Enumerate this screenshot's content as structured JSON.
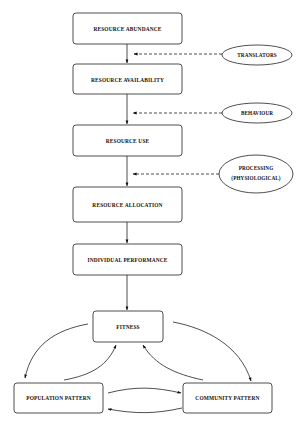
{
  "diagram": {
    "main_chain": [
      {
        "id": "abundance",
        "label": "RESOURCE ABUNDANCE"
      },
      {
        "id": "availability",
        "label": "RESOURCE AVAILABILITY"
      },
      {
        "id": "use",
        "label": "RESOURCE USE"
      },
      {
        "id": "allocation",
        "label": "RESOURCE ALLOCATION"
      },
      {
        "id": "performance",
        "label": "INDIVIDUAL PERFORMANCE"
      }
    ],
    "modifiers": [
      {
        "id": "translators",
        "lines": [
          "TRANSLATORS"
        ],
        "acts_on": "abundance → availability"
      },
      {
        "id": "behaviour",
        "lines": [
          "BEHAVIOUR"
        ],
        "acts_on": "availability → use"
      },
      {
        "id": "processing",
        "lines": [
          "PROCESSING",
          "(PHYSIOLOGICAL)"
        ],
        "acts_on": "use → allocation"
      }
    ],
    "outcomes": {
      "fitness": "FITNESS",
      "population": "POPULATION PATTERN",
      "community": "COMMUNITY PATTERN"
    },
    "edges": [
      {
        "from": "abundance",
        "to": "availability",
        "style": "solid"
      },
      {
        "from": "availability",
        "to": "use",
        "style": "solid"
      },
      {
        "from": "use",
        "to": "allocation",
        "style": "solid"
      },
      {
        "from": "allocation",
        "to": "performance",
        "style": "solid"
      },
      {
        "from": "performance",
        "to": "fitness",
        "style": "solid"
      },
      {
        "from": "translators",
        "to": "abundance-availability link",
        "style": "dashed"
      },
      {
        "from": "behaviour",
        "to": "availability-use link",
        "style": "dashed"
      },
      {
        "from": "processing",
        "to": "use-allocation link",
        "style": "dashed"
      },
      {
        "from": "fitness",
        "to": "population",
        "style": "curved"
      },
      {
        "from": "population",
        "to": "fitness",
        "style": "curved"
      },
      {
        "from": "fitness",
        "to": "community",
        "style": "curved"
      },
      {
        "from": "community",
        "to": "fitness",
        "style": "curved"
      },
      {
        "from": "population",
        "to": "community",
        "style": "curved"
      },
      {
        "from": "community",
        "to": "population",
        "style": "curved"
      }
    ]
  }
}
